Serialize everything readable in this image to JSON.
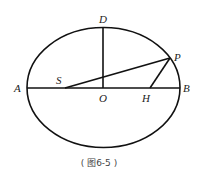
{
  "figure": {
    "caption": "( 图6-5 )",
    "stroke_color": "#111111",
    "labels": {
      "A": "A",
      "B": "B",
      "D": "D",
      "O": "O",
      "S": "S",
      "H": "H",
      "P": "P"
    },
    "elements": [
      {
        "type": "ellipse",
        "name": "orbit-ellipse"
      },
      {
        "type": "segment",
        "name": "major-axis",
        "from": "A",
        "to": "B"
      },
      {
        "type": "segment",
        "name": "semi-minor-axis",
        "from": "O",
        "to": "D"
      },
      {
        "type": "segment",
        "name": "radius-SP",
        "from": "S",
        "to": "P"
      },
      {
        "type": "segment",
        "name": "radius-HP",
        "from": "H",
        "to": "P"
      }
    ]
  }
}
